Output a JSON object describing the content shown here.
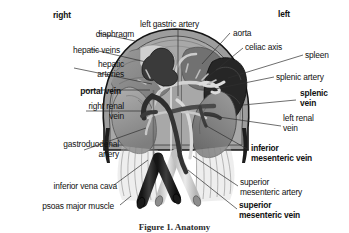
{
  "figure": {
    "caption": "Figure 1. Anatomy",
    "orientation": {
      "right_label": "right",
      "left_label": "left"
    },
    "colors": {
      "background": "#ffffff",
      "text": "#111111",
      "leader_line": "#2f2f2f",
      "diaphragm_outline": "#1c1c1c",
      "diaphragm_fill": "#9a9a9a",
      "liver_fill": "#8a8a8a",
      "liver_dark": "#6e6e6e",
      "kidney_fill": "#8e8e8e",
      "spleen_fill": "#3a3a3a",
      "vein_dark": "#2b2b2b",
      "artery_light": "#d8d8d8",
      "vessel_mid": "#b4b4b4",
      "psoas_fill": "#c9c9c9"
    }
  },
  "labels": [
    {
      "id": "right",
      "text": "right",
      "bold": true,
      "align": "left",
      "x": 53,
      "y": 11
    },
    {
      "id": "left",
      "text": "left",
      "bold": true,
      "align": "left",
      "x": 278,
      "y": 10
    },
    {
      "id": "left-gastric-artery",
      "text": "left gastric artery",
      "bold": false,
      "align": "left",
      "x": 140,
      "y": 20
    },
    {
      "id": "aorta",
      "text": "aorta",
      "bold": false,
      "align": "left",
      "x": 233,
      "y": 29
    },
    {
      "id": "celiac-axis",
      "text": "celiac axis",
      "bold": false,
      "align": "left",
      "x": 245,
      "y": 43
    },
    {
      "id": "spleen",
      "text": "spleen",
      "bold": false,
      "align": "left",
      "x": 305,
      "y": 51
    },
    {
      "id": "splenic-artery",
      "text": "splenic artery",
      "bold": false,
      "align": "left",
      "x": 276,
      "y": 73
    },
    {
      "id": "splenic-vein",
      "text": "splenic\nvein",
      "bold": true,
      "align": "left",
      "x": 300,
      "y": 89
    },
    {
      "id": "left-renal-vein",
      "text": "left renal\nvein",
      "bold": false,
      "align": "left",
      "x": 283,
      "y": 114
    },
    {
      "id": "inferior-mesenteric-vein",
      "text": "inferior\nmesenteric vein",
      "bold": true,
      "align": "left",
      "x": 251,
      "y": 144
    },
    {
      "id": "superior-mesenteric-artery",
      "text": "superior\nmesenteric artery",
      "bold": false,
      "align": "left",
      "x": 240,
      "y": 178
    },
    {
      "id": "superior-mesenteric-vein",
      "text": "superior\nmesenteric vein",
      "bold": true,
      "align": "left",
      "x": 239,
      "y": 201
    },
    {
      "id": "diaphragm",
      "text": "diaphragm",
      "bold": false,
      "align": "right",
      "x": 24,
      "y": 30
    },
    {
      "id": "hepatic-veins",
      "text": "hepatic veins",
      "bold": false,
      "align": "right",
      "x": 10,
      "y": 46
    },
    {
      "id": "hepatic-arteries",
      "text": "hepatic\narteries",
      "bold": false,
      "align": "right",
      "x": 14,
      "y": 60
    },
    {
      "id": "portal-vein",
      "text": "portal vein",
      "bold": true,
      "align": "right",
      "x": 11,
      "y": 87
    },
    {
      "id": "right-renal-vein",
      "text": "right renal\nvein",
      "bold": false,
      "align": "right",
      "x": 14,
      "y": 102
    },
    {
      "id": "gastroduodenal-artery",
      "text": "gastroduodenal\nartery",
      "bold": false,
      "align": "right",
      "x": 9,
      "y": 140
    },
    {
      "id": "inferior-vena-cava",
      "text": "inferior vena cava",
      "bold": false,
      "align": "right",
      "x": 7,
      "y": 182
    },
    {
      "id": "psoas-major-muscle",
      "text": "psoas major muscle",
      "bold": false,
      "align": "right",
      "x": 4,
      "y": 202
    }
  ],
  "leader_lines": [
    {
      "id": "leader-diaphragm",
      "from": [
        98,
        33
      ],
      "to": [
        135,
        41
      ]
    },
    {
      "id": "leader-hepatic-veins",
      "from": [
        90,
        49
      ],
      "to": [
        146,
        62
      ]
    },
    {
      "id": "leader-hepatic-arteries",
      "from": [
        74,
        68
      ],
      "to": [
        152,
        84
      ]
    },
    {
      "id": "leader-portal-vein",
      "from": [
        84,
        90
      ],
      "to": [
        150,
        90
      ]
    },
    {
      "id": "leader-right-renal-vein",
      "from": [
        86,
        111
      ],
      "to": [
        152,
        111
      ]
    },
    {
      "id": "leader-gastroduodenal-artery",
      "from": [
        84,
        150
      ],
      "to": [
        146,
        128
      ]
    },
    {
      "id": "leader-inferior-vena-cava",
      "from": [
        114,
        185
      ],
      "to": [
        148,
        160
      ]
    },
    {
      "id": "leader-psoas-major",
      "from": [
        120,
        205
      ],
      "to": [
        131,
        196
      ]
    },
    {
      "id": "leader-left-gastric-artery",
      "from": [
        178,
        29
      ],
      "to": [
        178,
        96
      ]
    },
    {
      "id": "leader-aorta",
      "from": [
        230,
        33
      ],
      "to": [
        202,
        64
      ]
    },
    {
      "id": "leader-celiac-axis",
      "from": [
        243,
        48
      ],
      "to": [
        204,
        80
      ]
    },
    {
      "id": "leader-spleen",
      "from": [
        303,
        55
      ],
      "to": [
        228,
        78
      ]
    },
    {
      "id": "leader-splenic-artery",
      "from": [
        274,
        77
      ],
      "to": [
        205,
        91
      ]
    },
    {
      "id": "leader-splenic-vein",
      "from": [
        296,
        100
      ],
      "to": [
        243,
        105
      ]
    },
    {
      "id": "leader-left-renal-vein",
      "from": [
        281,
        126
      ],
      "to": [
        205,
        115
      ]
    },
    {
      "id": "leader-inferior-mesenteric-vein",
      "from": [
        249,
        150
      ],
      "to": [
        205,
        125
      ]
    },
    {
      "id": "leader-superior-mesenteric-artery",
      "from": [
        238,
        186
      ],
      "to": [
        193,
        156
      ]
    },
    {
      "id": "leader-superior-mesenteric-vein",
      "from": [
        237,
        209
      ],
      "to": [
        188,
        170
      ]
    }
  ]
}
